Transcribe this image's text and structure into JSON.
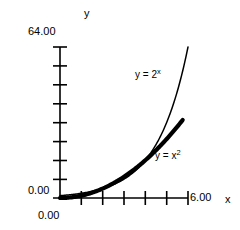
{
  "chart_data": {
    "type": "line",
    "title": "",
    "xlabel": "x",
    "ylabel": "y",
    "xlim": [
      0,
      6
    ],
    "ylim": [
      0,
      64
    ],
    "x_tick_labels": [
      "0.00",
      "6.00"
    ],
    "y_tick_labels": [
      "0.00",
      "64.00"
    ],
    "x_tick_values": [
      0,
      1,
      2,
      3,
      4,
      5,
      6
    ],
    "y_tick_values": [
      0,
      8,
      16,
      24,
      32,
      40,
      48,
      56,
      64
    ],
    "grid": false,
    "legend_position": "inline-annotation",
    "series": [
      {
        "name": "y = 2^x",
        "label_text": "y = 2",
        "label_exponent": "x",
        "style": "thin",
        "color": "#000000",
        "x": [
          0,
          0.5,
          1,
          1.5,
          2,
          2.5,
          3,
          3.5,
          4,
          4.5,
          5,
          5.5,
          6
        ],
        "y": [
          1,
          1.41,
          2,
          2.83,
          4,
          5.66,
          8,
          11.31,
          16,
          22.63,
          32,
          45.25,
          64
        ]
      },
      {
        "name": "y = x^2",
        "label_text": "y = x",
        "label_exponent": "2",
        "style": "thick",
        "color": "#000000",
        "x": [
          0,
          0.5,
          1,
          1.5,
          2,
          2.5,
          3,
          3.5,
          4,
          4.5,
          5,
          5.5,
          6
        ],
        "y": [
          0,
          0.25,
          1,
          2.25,
          4,
          6.25,
          9,
          12.25,
          16,
          20.25,
          25,
          30.25,
          36
        ]
      }
    ],
    "annotations": [
      {
        "text": "y = 2 x",
        "series": "y = 2^x"
      },
      {
        "text": "y = x 2",
        "series": "y = x^2"
      }
    ]
  },
  "axes": {
    "y_name": "y",
    "x_name": "x",
    "y_max": "64.00",
    "y_min": "0.00",
    "x_max": "6.00",
    "x_min": "0.00"
  },
  "labels": {
    "exp_base": "y = 2",
    "exp_sup": "x",
    "sq_base": "y = x",
    "sq_sup": "2"
  },
  "colors": {
    "ink": "#000000",
    "background": "#ffffff"
  }
}
